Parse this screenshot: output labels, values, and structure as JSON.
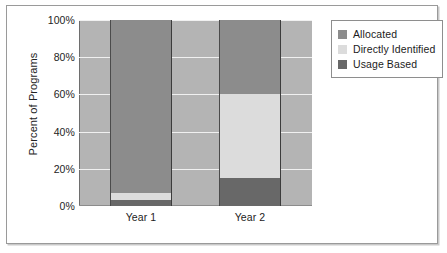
{
  "chart_data": {
    "type": "bar",
    "subtype": "stacked-100-percent",
    "title": "",
    "xlabel": "",
    "ylabel": "Percent of Programs",
    "categories": [
      "Year 1",
      "Year 2"
    ],
    "ylim": [
      0,
      100
    ],
    "ytick_labels": [
      "0%",
      "20%",
      "40%",
      "60%",
      "80%",
      "100%"
    ],
    "ytick_values": [
      0,
      20,
      40,
      60,
      80,
      100
    ],
    "grid": true,
    "grid_axis": "y",
    "legend_position": "right",
    "series": [
      {
        "name": "Allocated",
        "color": "#8c8c8c",
        "values": [
          93,
          40
        ]
      },
      {
        "name": "Directly Identified",
        "color": "#dcdcdc",
        "values": [
          4,
          45
        ]
      },
      {
        "name": "Usage Based",
        "color": "#686868",
        "values": [
          3,
          15
        ]
      }
    ],
    "stack_order_bottom_to_top": [
      "Usage Based",
      "Directly Identified",
      "Allocated"
    ],
    "plot_background": "#b4b4b4",
    "gridline_color": "#f0f0f0"
  },
  "legend": {
    "items": [
      {
        "label": "Allocated",
        "color": "#8c8c8c"
      },
      {
        "label": "Directly Identified",
        "color": "#dcdcdc"
      },
      {
        "label": "Usage Based",
        "color": "#686868"
      }
    ]
  }
}
